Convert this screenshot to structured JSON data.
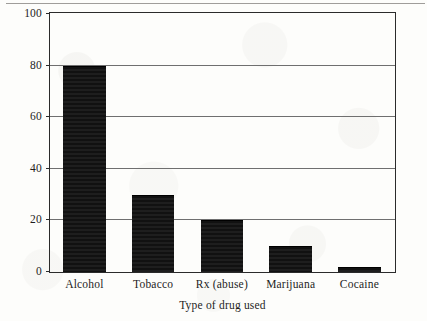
{
  "figure": {
    "background_color": "#fdfdfb",
    "frame_color": "#2b2b2b",
    "gridline_color": "#6f6f6f",
    "bar_color": "#111111"
  },
  "chart_data": {
    "type": "bar",
    "title": "",
    "subtitle": "",
    "xlabel": "Type of drug used",
    "ylabel": "Percentage of population",
    "categories": [
      "Alcohol",
      "Tobacco",
      "Rx (abuse)",
      "Marijuana",
      "Cocaine"
    ],
    "values": [
      80,
      30,
      20,
      10,
      2
    ],
    "ylim": [
      0,
      100
    ],
    "yticks": [
      0,
      20,
      40,
      60,
      80,
      100
    ],
    "ytick_labels": [
      "0",
      "20",
      "40",
      "60",
      "80",
      "100"
    ],
    "grid": true,
    "grid_axis": "y",
    "legend": false,
    "legend_position": "none",
    "bar_color": "#111111",
    "annotations": []
  }
}
